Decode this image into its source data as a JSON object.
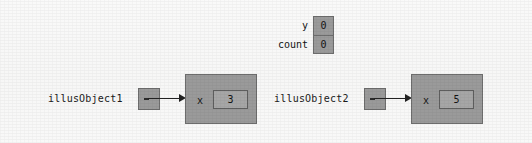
{
  "diagram": {
    "background_color": "#f8f8f7",
    "box_fill_color": "#9a9a9a",
    "box_border_color": "#6d6d6d",
    "value_fill_color": "#a6a6a6",
    "value_border_color": "#5e5e5e",
    "arrow_color": "#222222"
  },
  "variables": {
    "rows": [
      {
        "name": "y",
        "value": "0"
      },
      {
        "name": "count",
        "value": "0"
      }
    ]
  },
  "objects": [
    {
      "reference_label": "illusObject1",
      "field_name": "x",
      "field_value": "3"
    },
    {
      "reference_label": "illusObject2",
      "field_name": "x",
      "field_value": "5"
    }
  ]
}
